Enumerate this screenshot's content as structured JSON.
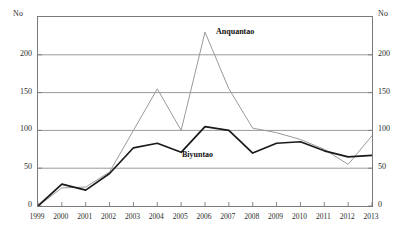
{
  "axis": {
    "unit_label_left": "No",
    "unit_label_right": "No",
    "y_ticks": [
      "200",
      "150",
      "100",
      "50",
      "0"
    ],
    "x_ticks": [
      "1999",
      "2000",
      "2001",
      "2002",
      "2003",
      "2004",
      "2005",
      "2006",
      "2007",
      "2008",
      "2009",
      "2010",
      "2011",
      "2012",
      "2013"
    ]
  },
  "series_labels": {
    "anquantao": "Anquantao",
    "biyuntao": "Biyuntao"
  },
  "colors": {
    "anquantao": "#9a9a9a",
    "biyuntao": "#1a1a1a",
    "gridline": "#8f8f8f",
    "frame": "#7a7a7a",
    "background": "#ffffff"
  },
  "chart_data": {
    "type": "line",
    "title": "",
    "subtitle": "",
    "xlabel": "",
    "ylabel": "No",
    "ylabel_right": "No",
    "x": [
      1999,
      2000,
      2001,
      2002,
      2003,
      2004,
      2005,
      2006,
      2007,
      2008,
      2009,
      2010,
      2011,
      2012,
      2013
    ],
    "categories": [
      "1999",
      "2000",
      "2001",
      "2002",
      "2003",
      "2004",
      "2005",
      "2006",
      "2007",
      "2008",
      "2009",
      "2010",
      "2011",
      "2012",
      "2013"
    ],
    "series": [
      {
        "name": "Anquantao",
        "color": "#9a9a9a",
        "values": [
          0,
          24,
          25,
          45,
          100,
          155,
          100,
          230,
          155,
          103,
          97,
          88,
          75,
          55,
          93
        ]
      },
      {
        "name": "Biyuntao",
        "color": "#1a1a1a",
        "values": [
          0,
          29,
          21,
          43,
          77,
          83,
          71,
          105,
          100,
          70,
          83,
          85,
          73,
          65,
          67
        ]
      }
    ],
    "ylim": [
      0,
      250
    ],
    "xlim": [
      1999,
      2013
    ],
    "y_ticks": [
      0,
      50,
      100,
      150,
      200
    ],
    "grid": true,
    "grid_axis": "y",
    "legend": "inline-annotations",
    "legend_position": "in-plot",
    "annotations": [
      {
        "text": "Anquantao",
        "series": "Anquantao"
      },
      {
        "text": "Biyuntao",
        "series": "Biyuntao"
      }
    ]
  }
}
